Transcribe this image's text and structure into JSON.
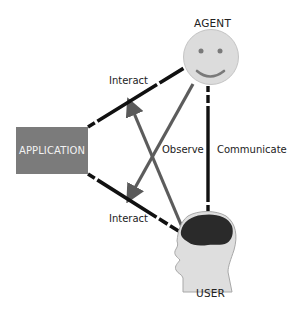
{
  "diagram": {
    "nodes": {
      "agent": {
        "label": "AGENT",
        "icon": "smiley-face-icon",
        "fill": "#dcdcdc"
      },
      "application": {
        "label": "APPLICATION",
        "fill": "#7b7b7b"
      },
      "user": {
        "label": "USER",
        "icon": "human-head-brain-icon",
        "fill": "#dedede",
        "brain_fill": "#2a2a2a"
      }
    },
    "edges": [
      {
        "from": "application",
        "to": "agent",
        "label": "Interact",
        "style": "dashed",
        "color": "#111111"
      },
      {
        "from": "application",
        "to": "user",
        "label": "Interact",
        "style": "dashed",
        "color": "#111111"
      },
      {
        "from": "agent",
        "to": "user",
        "label": "Communicate",
        "style": "dashed",
        "color": "#111111"
      },
      {
        "from": "agent",
        "to": "application-user-link",
        "label": "Observe",
        "style": "solid-arrow",
        "color": "#5a5a5a"
      },
      {
        "from": "user",
        "to": "application-agent-link",
        "label": "Observe",
        "style": "solid-arrow",
        "color": "#5a5a5a"
      }
    ],
    "labels": {
      "interact_top": "Interact",
      "interact_bottom": "Interact",
      "observe": "Observe",
      "communicate": "Communicate"
    }
  }
}
